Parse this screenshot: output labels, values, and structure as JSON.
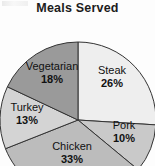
{
  "chart_data": {
    "type": "pie",
    "title": "Meals Served",
    "xlabel": "",
    "ylabel": "",
    "categories": [
      "Steak",
      "Pork",
      "Chicken",
      "Turkey",
      "Vegetarian"
    ],
    "values": [
      26,
      10,
      33,
      13,
      18
    ],
    "value_unit": "%",
    "legend": "none",
    "grid": false,
    "start_angle_deg": 0,
    "direction": "clockwise",
    "labels_inside_slices": true,
    "slices": [
      {
        "name": "Steak",
        "percent_label": "26%",
        "value": 26,
        "color": "#eeeeee"
      },
      {
        "name": "Pork",
        "percent_label": "10%",
        "value": 10,
        "color": "#c9c9c9"
      },
      {
        "name": "Chicken",
        "percent_label": "33%",
        "value": 33,
        "color": "#bcbcbc"
      },
      {
        "name": "Turkey",
        "percent_label": "13%",
        "value": 13,
        "color": "#d4d4d4"
      },
      {
        "name": "Vegetarian",
        "percent_label": "18%",
        "value": 18,
        "color": "#9a9a9a"
      }
    ]
  },
  "chart": {
    "title": "Meals Served",
    "outline_color": "#333333",
    "text_color": "#111111",
    "background": "#fdfdfd"
  },
  "labels": {
    "steak": {
      "name": "Steak",
      "pct": "26%"
    },
    "pork": {
      "name": "Pork",
      "pct": "10%"
    },
    "chicken": {
      "name": "Chicken",
      "pct": "33%"
    },
    "turkey": {
      "name": "Turkey",
      "pct": "13%"
    },
    "vegetarian": {
      "name": "Vegetarian",
      "pct": "18%"
    }
  }
}
